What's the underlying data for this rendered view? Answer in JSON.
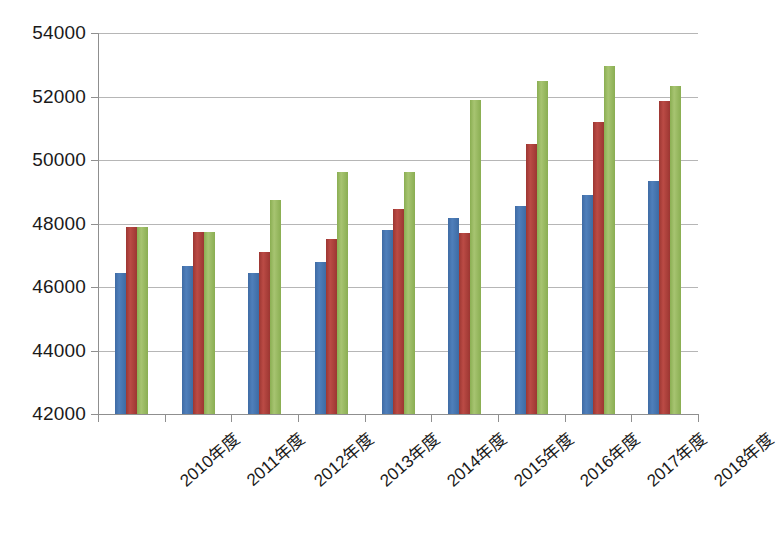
{
  "chart_data": {
    "type": "bar",
    "title": "",
    "subtitle": "",
    "xlabel": "",
    "ylabel": "",
    "ylim": [
      42000,
      54000
    ],
    "ytick_step": 2000,
    "yticks": [
      42000,
      44000,
      46000,
      48000,
      50000,
      52000,
      54000
    ],
    "ytick_labels": [
      "42000",
      "44000",
      "46000",
      "48000",
      "50000",
      "52000",
      "54000"
    ],
    "grid": true,
    "grid_axis": "y",
    "legend": false,
    "legend_position": "none",
    "categories": [
      "2010年度",
      "2011年度",
      "2012年度",
      "2013年度",
      "2014年度",
      "2015年度",
      "2016年度",
      "2017年度",
      "2018年度"
    ],
    "series": [
      {
        "name": "series-1",
        "color": "#4472a8",
        "values": [
          46450,
          46650,
          46450,
          46780,
          47800,
          48180,
          48550,
          48900,
          49350
        ]
      },
      {
        "name": "series-2",
        "color": "#a93b36",
        "values": [
          47900,
          47730,
          47100,
          47500,
          48450,
          47700,
          50500,
          51200,
          51850
        ]
      },
      {
        "name": "series-3",
        "color": "#91b558",
        "values": [
          47880,
          47730,
          48730,
          49620,
          49630,
          51900,
          52480,
          52950,
          52320
        ]
      }
    ],
    "annotations": []
  },
  "colors": {
    "series_1": "#4472a8",
    "series_2": "#a93b36",
    "series_3": "#91b558",
    "gridline": "#9a9a9a",
    "axis": "#8f8f8f",
    "text": "#1a1a1a",
    "background": "#ffffff"
  },
  "caption": {
    "text": ""
  }
}
